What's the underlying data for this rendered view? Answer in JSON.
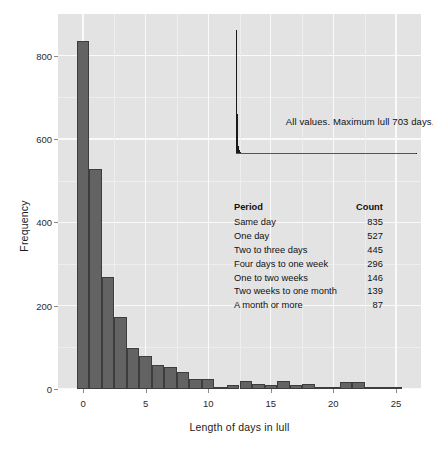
{
  "chart_data": {
    "type": "bar",
    "title": "",
    "subtitle": "",
    "xlabel": "Length of days in lull",
    "ylabel": "Frequency",
    "xlim": [
      -2,
      27
    ],
    "ylim": [
      0,
      900
    ],
    "xticks": [
      0,
      5,
      10,
      15,
      20,
      25
    ],
    "yticks": [
      0,
      200,
      400,
      600,
      800
    ],
    "grid": true,
    "legend": null,
    "bar_color": "#636363",
    "panel_color": "#e3e3e3",
    "gridline_color": "#fafafa",
    "binwidth": 1,
    "x": [
      0,
      1,
      2,
      3,
      4,
      5,
      6,
      7,
      8,
      9,
      10,
      11,
      12,
      13,
      14,
      15,
      16,
      17,
      18,
      19,
      20,
      21,
      22,
      23,
      24,
      25
    ],
    "values": [
      835,
      527,
      268,
      174,
      99,
      80,
      57,
      53,
      40,
      25,
      24,
      3,
      10,
      20,
      12,
      10,
      19,
      10,
      11,
      2,
      3,
      18,
      17,
      5,
      6,
      3
    ],
    "annotations": [
      {
        "text": "All values. Maximum lull 703 days.",
        "x": 16.2,
        "y": 640
      }
    ],
    "inset": {
      "description": "miniature histogram of all lull values, spike at zero",
      "x": [
        0,
        1,
        2,
        3,
        4,
        5,
        6,
        7,
        8,
        9,
        10,
        12,
        14,
        16,
        18,
        20,
        24,
        28,
        34,
        40,
        50,
        60,
        75,
        90,
        120,
        160,
        220,
        300,
        400,
        520,
        703
      ],
      "values": [
        835,
        527,
        268,
        174,
        99,
        80,
        57,
        53,
        40,
        25,
        24,
        18,
        14,
        11,
        9,
        7,
        6,
        5,
        4,
        4,
        3,
        3,
        2,
        2,
        2,
        1,
        1,
        1,
        1,
        1,
        1
      ]
    },
    "table": {
      "columns": [
        "Period",
        "Count"
      ],
      "rows": [
        [
          "Same day",
          "835"
        ],
        [
          "One day",
          "527"
        ],
        [
          "Two to three days",
          "445"
        ],
        [
          "Four days to one week",
          "296"
        ],
        [
          "One to two weeks",
          "146"
        ],
        [
          "Two weeks to one month",
          "139"
        ],
        [
          "A month or more",
          "87"
        ]
      ]
    }
  }
}
